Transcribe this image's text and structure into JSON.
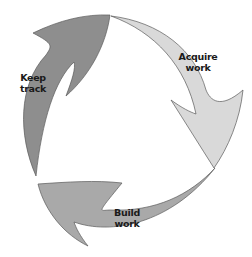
{
  "diagram": {
    "type": "cycle",
    "steps": [
      {
        "label_line1": "Acquire",
        "label_line2": "work",
        "color": "#d9d9d9"
      },
      {
        "label_line1": "Build",
        "label_line2": "work",
        "color": "#a9a9a9"
      },
      {
        "label_line1": "Keep",
        "label_line2": "track",
        "color": "#8e8e8e"
      }
    ],
    "outline_color": "#555555"
  }
}
